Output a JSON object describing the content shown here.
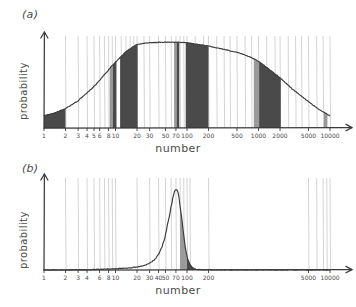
{
  "figure": {
    "background": "#ffffff",
    "ink": "#3a3a3a",
    "fill_dark": "#4a4a4a",
    "fill_gray": "#9a9a9a",
    "gridline": "#cfcfcf"
  },
  "panels": [
    {
      "id": "a",
      "label": "(a)",
      "ylabel": "probability",
      "xlabel": "number",
      "chart_data": {
        "type": "area",
        "title": "(a)",
        "xlabel": "number",
        "ylabel": "probability",
        "xscale": "log",
        "xlim": [
          1,
          10000
        ],
        "ylim": [
          0,
          1
        ],
        "grid": true,
        "legend": null,
        "tick_labels": [
          "1",
          "2",
          "3",
          "4",
          "5",
          "6",
          "8",
          "10",
          "20",
          "30",
          "50",
          "70",
          "100",
          "200",
          "500",
          "1000",
          "2000",
          "5000",
          "10000"
        ],
        "tick_values": [
          1,
          2,
          3,
          4,
          5,
          6,
          8,
          10,
          20,
          30,
          50,
          70,
          100,
          200,
          500,
          1000,
          2000,
          5000,
          10000
        ],
        "curve_x": [
          1,
          1.4,
          2,
          3,
          4,
          5,
          6,
          8,
          10,
          14,
          20,
          30,
          50,
          70,
          100,
          140,
          200,
          300,
          500,
          700,
          1000,
          1400,
          2000,
          3000,
          5000,
          7000,
          10000
        ],
        "curve_y": [
          0.14,
          0.17,
          0.22,
          0.31,
          0.4,
          0.47,
          0.54,
          0.66,
          0.75,
          0.87,
          0.95,
          0.97,
          0.975,
          0.975,
          0.97,
          0.95,
          0.93,
          0.9,
          0.86,
          0.82,
          0.76,
          0.67,
          0.57,
          0.44,
          0.3,
          0.21,
          0.14
        ],
        "gridline_values": [
          2,
          3,
          4,
          5,
          6,
          7,
          8,
          9,
          10,
          12,
          14,
          16,
          18,
          20,
          25,
          30,
          40,
          50,
          60,
          70,
          80,
          90,
          100,
          130,
          170,
          200,
          260,
          330,
          400,
          500,
          650,
          800,
          1000,
          1300,
          1700,
          2000,
          2600,
          3300,
          4000,
          5000,
          6500,
          8000,
          10000
        ],
        "shaded_bands_dark": [
          {
            "from": 1,
            "to": 2
          },
          {
            "from": 9.2,
            "to": 10.3
          },
          {
            "from": 11.6,
            "to": 20.4
          },
          {
            "from": 72,
            "to": 78
          },
          {
            "from": 96,
            "to": 200
          },
          {
            "from": 1020,
            "to": 2050
          }
        ],
        "shaded_bands_gray": [
          {
            "from": 8.3,
            "to": 9.2
          },
          {
            "from": 66,
            "to": 72
          },
          {
            "from": 860,
            "to": 1020
          },
          {
            "from": 8200,
            "to": 9200
          }
        ]
      }
    },
    {
      "id": "b",
      "label": "(b)",
      "ylabel": "probability",
      "xlabel": "number",
      "chart_data": {
        "type": "area",
        "title": "(b)",
        "xlabel": "number",
        "ylabel": "probability",
        "xscale": "log",
        "xlim": [
          1,
          10000
        ],
        "ylim": [
          0,
          1
        ],
        "grid": true,
        "legend": null,
        "tick_labels": [
          "1",
          "2",
          "3",
          "4",
          "6",
          "8",
          "10",
          "20",
          "30",
          "40",
          "50",
          "70",
          "100",
          "200",
          "5000",
          "10000"
        ],
        "tick_values": [
          1,
          2,
          3,
          4,
          6,
          8,
          10,
          20,
          30,
          40,
          50,
          70,
          100,
          200,
          5000,
          10000
        ],
        "curve_x": [
          1,
          2,
          4,
          8,
          10,
          15,
          20,
          25,
          30,
          35,
          40,
          45,
          50,
          55,
          60,
          65,
          70,
          75,
          80,
          85,
          90,
          95,
          100,
          110,
          120,
          130,
          150,
          200,
          400,
          1000,
          10000
        ],
        "curve_y": [
          0.001,
          0.002,
          0.004,
          0.01,
          0.013,
          0.022,
          0.034,
          0.05,
          0.075,
          0.115,
          0.175,
          0.265,
          0.395,
          0.56,
          0.73,
          0.87,
          0.94,
          0.9,
          0.76,
          0.57,
          0.385,
          0.24,
          0.14,
          0.055,
          0.022,
          0.01,
          0.004,
          0.001,
          0.0004,
          0.0002,
          0.0001
        ],
        "gridline_values": [
          2,
          3,
          4,
          5,
          6,
          7,
          8,
          9,
          10,
          20,
          30,
          40,
          50,
          60,
          70,
          80,
          90,
          100,
          110,
          200,
          5000,
          6500,
          8000,
          9000,
          10000
        ],
        "shaded_bands_dark": [
          {
            "from": 100,
            "to": 132
          }
        ],
        "shaded_bands_gray": [
          {
            "from": 80,
            "to": 100
          }
        ]
      }
    }
  ]
}
